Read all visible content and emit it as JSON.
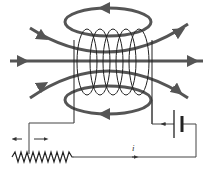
{
  "diagram": {
    "current_label": "i",
    "components": [
      "solenoid-coil",
      "magnetic-field-lines",
      "battery",
      "variable-resistor",
      "slider-arrows"
    ],
    "colors": {
      "field_line": "#555555",
      "wire": "#444444",
      "background": "#ffffff"
    }
  }
}
